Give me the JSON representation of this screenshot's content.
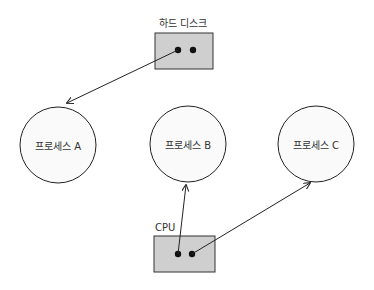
{
  "diagram": {
    "type": "process-resource-allocation",
    "hard_disk": {
      "label": "하드 디스크",
      "fill": "#cfcfcf"
    },
    "cpu": {
      "label": "CPU",
      "fill": "#cfcfcf"
    },
    "processes": [
      {
        "id": "A",
        "label": "프로세스 A"
      },
      {
        "id": "B",
        "label": "프로세스 B"
      },
      {
        "id": "C",
        "label": "프로세스 C"
      }
    ],
    "edges": [
      {
        "from": "하드 디스크",
        "to": "프로세스 A"
      },
      {
        "from": "CPU",
        "to": "프로세스 B"
      },
      {
        "from": "CPU",
        "to": "프로세스 C"
      }
    ]
  }
}
